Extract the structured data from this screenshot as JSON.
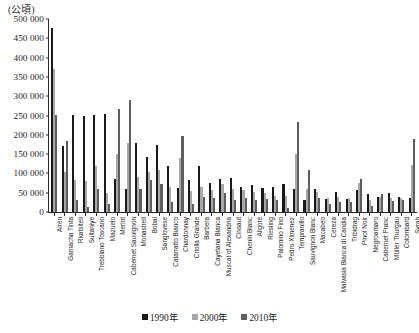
{
  "unit_label": "(公頃)",
  "chart_data": {
    "type": "bar",
    "title": "",
    "subtitle": "",
    "xlabel": "",
    "ylabel": "(公頃)",
    "ylim": [
      0,
      500000
    ],
    "ytick_step": 50000,
    "grid": false,
    "legend_position": "bottom-center",
    "ytick_labels": [
      "500 000",
      "450 000",
      "400 000",
      "350 000",
      "300 000",
      "250 000",
      "200 000",
      "150 000",
      "100 000",
      "50 000",
      "0"
    ],
    "ytick_values": [
      500000,
      450000,
      400000,
      350000,
      300000,
      250000,
      200000,
      150000,
      100000,
      50000,
      0
    ],
    "categories": [
      "Airen",
      "Garnacha Tinta",
      "Rkatsiteli",
      "Sultaniye",
      "Trebbiano Toscano",
      "Mazuelo",
      "Merlot",
      "Cabernet Sauvignon",
      "Monastrell",
      "Bobal",
      "Sangiovese",
      "Catarratto Bianco",
      "Chardonnay",
      "Criolla Grande",
      "Barbera",
      "Cayetana Blanca",
      "Muscat of Alexandria",
      "Cinsaut",
      "Chenin Blanc",
      "Aligoté",
      "Riesling",
      "Palomino Fino",
      "Pedro Ximenez",
      "Tempranillo",
      "Sauvignon Blanc",
      "Macabeo",
      "Cereza",
      "Malvasia Bianca di Candia",
      "Tribidrag",
      "Pinot Noir",
      "Negroamaro",
      "Cabernet Franc",
      "Müller Thurgau",
      "Colombard",
      "Syrah"
    ],
    "series": [
      {
        "name": "1990年",
        "color": "#1a1a1a",
        "values": [
          476000,
          170000,
          252000,
          250000,
          252000,
          253000,
          86000,
          60000,
          180000,
          143000,
          174000,
          118000,
          62000,
          84000,
          118000,
          75000,
          85000,
          87000,
          65000,
          70000,
          62000,
          65000,
          73000,
          60000,
          32000,
          59000,
          35000,
          52000,
          35000,
          56000,
          47000,
          38000,
          50000,
          40000,
          37000
        ]
      },
      {
        "name": "2000年",
        "color": "#a8a8a8",
        "values": [
          370000,
          104000,
          82000,
          80000,
          120000,
          50000,
          150000,
          180000,
          90000,
          104000,
          110000,
          66000,
          140000,
          55000,
          65000,
          56000,
          72000,
          60000,
          56000,
          52000,
          50000,
          42000,
          42000,
          150000,
          60000,
          52000,
          37000,
          40000,
          36000,
          74000,
          30000,
          38000,
          37000,
          36000,
          122000
        ]
      },
      {
        "name": "2010年",
        "color": "#5e5e5e",
        "values": [
          252000,
          184000,
          30000,
          12000,
          60000,
          22000,
          266000,
          290000,
          60000,
          82000,
          72000,
          26000,
          198000,
          20000,
          40000,
          36000,
          50000,
          30000,
          36000,
          30000,
          34000,
          30000,
          10000,
          232000,
          110000,
          37000,
          22000,
          26000,
          26000,
          86000,
          16000,
          46000,
          28000,
          30000,
          190000
        ]
      }
    ]
  },
  "legend": {
    "entries": [
      {
        "label": "1990年",
        "color": "#1a1a1a",
        "key": "y1990"
      },
      {
        "label": "2000年",
        "color": "#a8a8a8",
        "key": "y2000"
      },
      {
        "label": "2010年",
        "color": "#5e5e5e",
        "key": "y2010"
      }
    ]
  }
}
